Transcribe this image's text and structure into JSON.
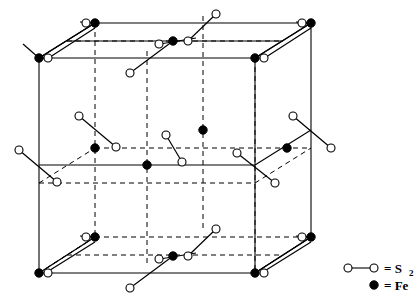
{
  "figure": {
    "width": 417,
    "height": 302,
    "background": "#ffffff",
    "stroke_color": "#000000"
  },
  "legend": {
    "items": [
      {
        "symbol": "s2-pair",
        "label": "= S",
        "subscript": "2",
        "marker": "open-circle-pair-with-bond"
      },
      {
        "symbol": "fe-atom",
        "label": "= Fe",
        "subscript": "",
        "marker": "filled-circle"
      }
    ],
    "s2_x1": 348,
    "s2_y1": 268,
    "s2_x2": 374,
    "s2_y2": 268,
    "fe_x": 374,
    "fe_y": 285
  },
  "cell": {
    "type": "cubic-unit-cell",
    "projection": "oblique",
    "front_left_x": 39,
    "front_top_y": 58,
    "front_right_x": 255,
    "front_bottom_y": 273,
    "depth_dx": 56,
    "depth_dy": -35,
    "solid_edges": 9,
    "dashed_edges": 3,
    "internal_dashed_guides": 12
  },
  "atoms": {
    "fe_label": "Fe",
    "s_label": "S",
    "fe_radius": 4.2,
    "s_radius": 4.0,
    "fe_count": 16,
    "s2_count": 16,
    "fe_sites": [
      {
        "name": "corner-front-top-left",
        "x": 39,
        "y": 58
      },
      {
        "name": "corner-back-top-left",
        "x": 95,
        "y": 23
      },
      {
        "name": "corner-back-top-right",
        "x": 311,
        "y": 23
      },
      {
        "name": "corner-front-top-right",
        "x": 255,
        "y": 58
      },
      {
        "name": "corner-front-bottom-left",
        "x": 39,
        "y": 273
      },
      {
        "name": "corner-back-bottom-left",
        "x": 95,
        "y": 237
      },
      {
        "name": "corner-back-bottom-right",
        "x": 311,
        "y": 237
      },
      {
        "name": "corner-front-bottom-right",
        "x": 255,
        "y": 273
      },
      {
        "name": "face-center-top",
        "x": 173,
        "y": 41
      },
      {
        "name": "face-center-bottom",
        "x": 173,
        "y": 256
      },
      {
        "name": "face-center-front",
        "x": 147,
        "y": 165
      },
      {
        "name": "face-center-back",
        "x": 203,
        "y": 130
      },
      {
        "name": "face-center-left",
        "x": 95,
        "y": 148
      },
      {
        "name": "face-center-right",
        "x": 311,
        "y": 148
      },
      {
        "name": "edge-mid-left-front",
        "x": 39,
        "y": 165
      },
      {
        "name": "edge-mid-right-front",
        "x": 255,
        "y": 165
      }
    ],
    "s2_dumbbells": [
      {
        "name": "s2-corner-ftl",
        "x1": 23,
        "y1": 148,
        "x2": 58,
        "y2": 183
      },
      {
        "name": "s2-corner-btl",
        "x1": 68,
        "y1": 78,
        "x2": 103,
        "y2": 113
      },
      {
        "name": "s2-corner-ftr",
        "x1": 239,
        "y1": 148,
        "x2": 274,
        "y2": 183
      },
      {
        "name": "s2-corner-btr",
        "x1": 284,
        "y1": 78,
        "x2": 319,
        "y2": 113
      }
    ]
  },
  "colors": {
    "line": "#000000",
    "fill_open": "#ffffff",
    "fill_solid": "#000000",
    "page": "#ffffff"
  }
}
